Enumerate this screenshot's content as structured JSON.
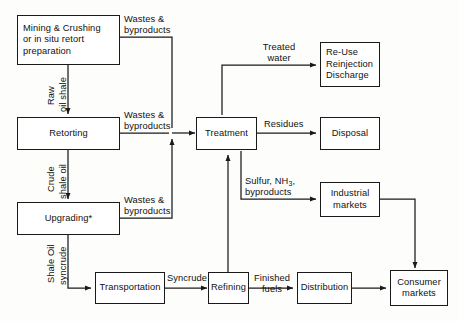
{
  "diagram": {
    "footnote_marker": "*",
    "nodes": {
      "mining": {
        "line1": "Mining & Crushing",
        "line2": "or in situ retort",
        "line3": "preparation"
      },
      "retorting": {
        "label": "Retorting"
      },
      "upgrading": {
        "label": "Upgrading*"
      },
      "transportation": {
        "label": "Transportation"
      },
      "treatment": {
        "label": "Treatment"
      },
      "refining": {
        "label": "Refining"
      },
      "distribution": {
        "label": "Distribution"
      },
      "reuse": {
        "line1": "Re-Use",
        "line2": "Reinjection",
        "line3": "Discharge"
      },
      "disposal": {
        "label": "Disposal"
      },
      "industrial_markets": {
        "line1": "Industrial",
        "line2": "markets"
      },
      "consumer_markets": {
        "line1": "Consumer",
        "line2": "markets"
      }
    },
    "edge_labels": {
      "wastes_mining": {
        "line1": "Wastes &",
        "line2": "byproducts"
      },
      "wastes_retorting": {
        "line1": "Wastes &",
        "line2": "byproducts"
      },
      "wastes_upgrading": {
        "line1": "Wastes &",
        "line2": "byproducts"
      },
      "raw_oil_shale": {
        "line1": "Raw",
        "line2": "oil shale"
      },
      "crude_shale_oil": {
        "line1": "Crude",
        "line2": "shale oil"
      },
      "shale_oil_syncrude": {
        "line1": "Shale Oil",
        "line2": "syncrude"
      },
      "treated_water": {
        "line1": "Treated",
        "line2": "water"
      },
      "residues": {
        "label": "Residues"
      },
      "sulfur_byproducts": {
        "line1_a": "Sulfur, NH",
        "line1_sub": "3",
        "line1_b": ",",
        "line2": "byproducts"
      },
      "syncrude": {
        "label": "Syncrude"
      },
      "finished_fuels": {
        "line1": "Finished",
        "line2": "fuels"
      }
    },
    "colors": {
      "stroke": "#1a1a1a",
      "text": "#111111",
      "background": "#fdfdfc"
    }
  }
}
